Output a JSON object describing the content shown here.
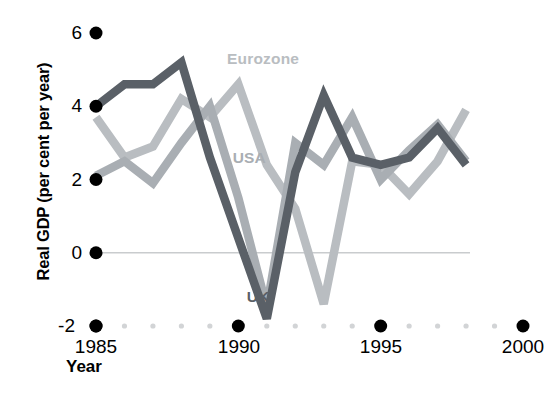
{
  "chart_data": {
    "type": "line",
    "title": "",
    "xlabel": "Year",
    "ylabel": "Real GDP (per cent per year)",
    "xlim": [
      1985,
      2000
    ],
    "ylim": [
      -2,
      6
    ],
    "xticks": [
      1985,
      1990,
      1995,
      2000
    ],
    "yticks": [
      -2,
      0,
      2,
      4,
      6
    ],
    "xtick_labels": [
      "1985",
      "1990",
      "1995",
      "2000"
    ],
    "ytick_labels": [
      "-2",
      "0",
      "2",
      "4",
      "6"
    ],
    "grid": false,
    "zero_line": true,
    "legend_position": "inline-annotations",
    "x": [
      1985,
      1986,
      1987,
      1988,
      1989,
      1990,
      1991,
      1992,
      1993,
      1994,
      1995,
      1996,
      1997,
      1998
    ],
    "series": [
      {
        "name": "Eurozone",
        "color": "#b9bdc1",
        "label_x": 1989.6,
        "label_y": 5.3,
        "values": [
          3.7,
          2.6,
          2.9,
          4.2,
          3.7,
          4.6,
          2.4,
          1.2,
          -1.4,
          2.5,
          2.4,
          1.6,
          2.5,
          3.9
        ]
      },
      {
        "name": "USA",
        "color": "#a9aeb3",
        "label_x": 1989.8,
        "label_y": 2.6,
        "values": [
          2.1,
          2.5,
          1.9,
          3.0,
          4.0,
          1.5,
          -1.5,
          3.0,
          2.4,
          3.7,
          2.0,
          2.8,
          3.5,
          2.5
        ]
      },
      {
        "name": "UK",
        "color": "#5a6067",
        "label_x": 1990.3,
        "label_y": -1.2,
        "values": [
          4.0,
          4.6,
          4.6,
          5.2,
          2.6,
          0.4,
          -1.8,
          2.2,
          4.3,
          2.6,
          2.4,
          2.6,
          3.4,
          2.4
        ]
      }
    ]
  },
  "axis": {
    "y_title": "Real GDP (per cent per year)",
    "x_title": "Year"
  },
  "colors": {
    "tick_major": "#000000",
    "tick_minor": "#d2d4d6",
    "zero_line": "#c9ccce",
    "text": "#000000"
  }
}
